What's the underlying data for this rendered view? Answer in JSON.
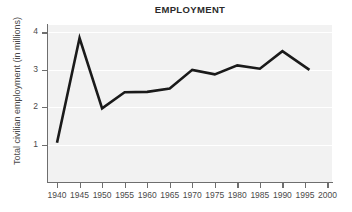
{
  "chart_data": {
    "type": "line",
    "title": "EMPLOYMENT",
    "xlabel": "",
    "ylabel": "Total civilian employment (in millions)",
    "x": [
      1940,
      1945,
      1950,
      1955,
      1960,
      1965,
      1970,
      1975,
      1980,
      1985,
      1990,
      1996
    ],
    "values": [
      1.05,
      3.85,
      1.97,
      2.4,
      2.41,
      2.5,
      3.0,
      2.88,
      3.12,
      3.03,
      3.5,
      3.0
    ],
    "series": [
      {
        "name": "Total civilian employment",
        "values": [
          1.05,
          3.85,
          1.97,
          2.4,
          2.41,
          2.5,
          3.0,
          2.88,
          3.12,
          3.03,
          3.5,
          3.0
        ]
      }
    ],
    "xlim": [
      1938,
      2001
    ],
    "ylim": [
      0,
      4.2
    ],
    "xticks": [
      1940,
      1945,
      1950,
      1955,
      1960,
      1965,
      1970,
      1975,
      1980,
      1985,
      1990,
      1995,
      2000
    ],
    "xtick_labels": [
      "1940",
      "1945",
      "1950",
      "1955",
      "1960",
      "1965",
      "1970",
      "1975",
      "1980",
      "1985",
      "1990",
      "1995",
      "2000"
    ],
    "yticks": [
      1,
      2,
      3,
      4
    ],
    "ytick_labels": [
      "1",
      "2",
      "3",
      "4"
    ],
    "grid": true,
    "grid_axis": "y",
    "legend": false,
    "legend_position": "none",
    "line_color": "#1a1a1a",
    "plot_background": "#f2f2f2",
    "gridline_color": "#ffffff",
    "axis_color": "#6e6e6e"
  }
}
